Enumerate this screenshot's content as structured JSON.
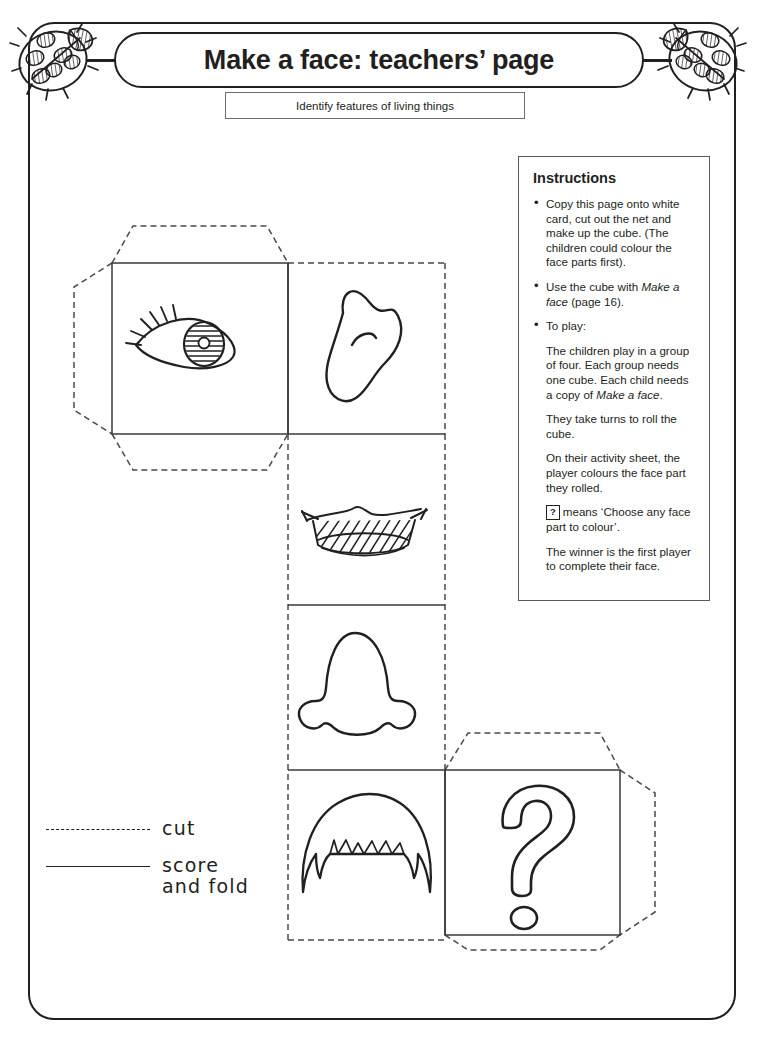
{
  "page": {
    "title": "Make a face: teachers’ page",
    "subtitle": "Identify features of living things"
  },
  "decorations": {
    "ladybird_left": "ladybird-illustration",
    "ladybird_right": "ladybird-illustration"
  },
  "instructions": {
    "heading": "Instructions",
    "bullets": [
      "Copy this page onto white card, cut out the net and make up the cube. (The children could colour the face parts first).",
      "Use the cube with Make a face (page 16).",
      "To play:"
    ],
    "bullet2_prefix": "Use the cube with ",
    "bullet2_italic": "Make a face",
    "bullet2_suffix": " (page 16).",
    "paragraphs": [
      "The children play in a group of four. Each group needs one cube. Each child needs a copy of Make a face.",
      "They take turns to roll the cube.",
      "On their activity sheet, the player colours the face part they rolled.",
      "means ‘Choose any face part to colour’.",
      "The winner is the first player to complete their face."
    ],
    "para1_prefix": "The children play in a group of four. Each group needs one cube. Each child needs a copy of ",
    "para1_italic": "Make a face",
    "para1_suffix": ".",
    "qmark_chip": "?",
    "qmark_sentence": "means ‘Choose any face part to colour’."
  },
  "legend": {
    "cut_label": "cut",
    "score_label_line1": "score",
    "score_label_line2": "and fold"
  },
  "net": {
    "panels": [
      {
        "name": "eye",
        "icon": "eye-icon"
      },
      {
        "name": "ear",
        "icon": "ear-icon"
      },
      {
        "name": "mouth",
        "icon": "mouth-icon"
      },
      {
        "name": "nose",
        "icon": "nose-icon"
      },
      {
        "name": "hair",
        "icon": "hair-icon"
      },
      {
        "name": "question",
        "icon": "question-mark-icon"
      }
    ]
  },
  "colors": {
    "ink": "#231f20",
    "panel_line": "#3a3a3a",
    "cut_line": "#4a4a4a"
  },
  "footer": {
    "text": ""
  }
}
